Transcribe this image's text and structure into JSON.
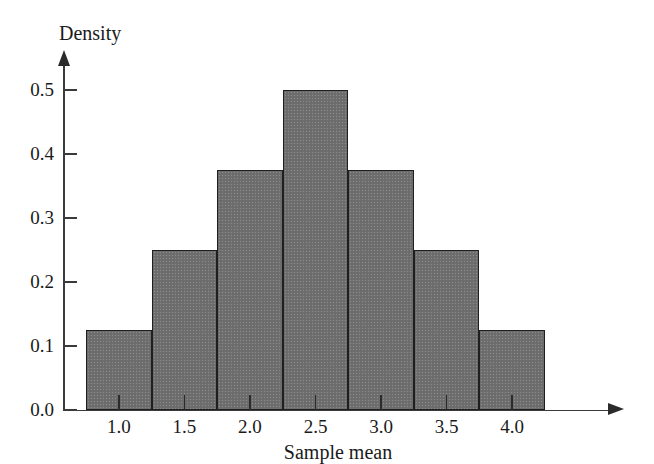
{
  "chart_data": {
    "type": "bar",
    "title": "",
    "xlabel": "Sample mean",
    "ylabel": "Density",
    "categories": [
      "1.0",
      "1.5",
      "2.0",
      "2.5",
      "3.0",
      "3.5",
      "4.0"
    ],
    "values": [
      0.125,
      0.25,
      0.375,
      0.5,
      0.375,
      0.25,
      0.125
    ],
    "bin_centers": [
      1.0,
      1.5,
      2.0,
      2.5,
      3.0,
      3.5,
      4.0
    ],
    "bin_width": 0.5,
    "bin_edges": [
      0.75,
      1.25,
      1.75,
      2.25,
      2.75,
      3.25,
      3.75,
      4.25
    ],
    "xlim": [
      0.75,
      4.25
    ],
    "ylim": [
      0.0,
      0.5
    ],
    "x_ticks": [
      "1.0",
      "1.5",
      "2.0",
      "2.5",
      "3.0",
      "3.5",
      "4.0"
    ],
    "y_ticks": [
      "0.0",
      "0.1",
      "0.2",
      "0.3",
      "0.4",
      "0.5"
    ],
    "y_tick_values": [
      0.0,
      0.1,
      0.2,
      0.3,
      0.4,
      0.5
    ],
    "grid": false,
    "legend": null,
    "bar_fill_color": "#706f6f",
    "bar_edge_color": "#1f1f1f",
    "axis_color": "#3a3a3a",
    "background_color": "#ffffff"
  },
  "axes": {
    "y_title": "Density",
    "x_title": "Sample mean"
  }
}
